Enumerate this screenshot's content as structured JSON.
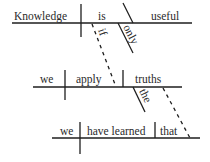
{
  "diagram": {
    "type": "sentence-diagram",
    "main_clause": {
      "subject": "Knowledge",
      "verb": "is",
      "complement": "useful",
      "modifier": "only"
    },
    "connector_if": "if",
    "conditional_clause": {
      "subject": "we",
      "verb": "apply",
      "object": "truths",
      "modifier": "the"
    },
    "relative_clause": {
      "subject": "we",
      "verb": "have learned",
      "object": "that"
    }
  }
}
